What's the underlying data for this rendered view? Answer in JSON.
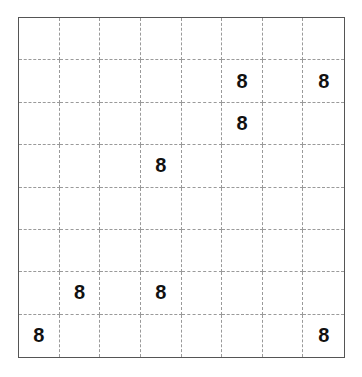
{
  "puzzle": {
    "rows": 8,
    "cols": 8,
    "grid": [
      [
        "",
        "",
        "",
        "",
        "",
        "",
        "",
        ""
      ],
      [
        "",
        "",
        "",
        "",
        "",
        "8",
        "",
        "8"
      ],
      [
        "",
        "",
        "",
        "",
        "",
        "8",
        "",
        ""
      ],
      [
        "",
        "",
        "",
        "8",
        "",
        "",
        "",
        ""
      ],
      [
        "",
        "",
        "",
        "",
        "",
        "",
        "",
        ""
      ],
      [
        "",
        "",
        "",
        "",
        "",
        "",
        "",
        ""
      ],
      [
        "",
        "8",
        "",
        "8",
        "",
        "",
        "",
        ""
      ],
      [
        "8",
        "",
        "",
        "",
        "",
        "",
        "",
        "8"
      ]
    ]
  },
  "colors": {
    "border": "#555555",
    "gridline": "#9a9a9a",
    "digit": "#111111",
    "background": "#ffffff"
  }
}
